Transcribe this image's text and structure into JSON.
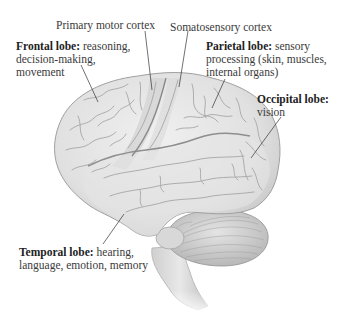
{
  "diagram": {
    "labels": [
      {
        "id": "primary-motor-cortex",
        "title": "Primary motor cortex",
        "description": ""
      },
      {
        "id": "somatosensory-cortex",
        "title": "Somatosensory cortex",
        "description": ""
      },
      {
        "id": "frontal-lobe",
        "title": "Frontal lobe:",
        "description_lines": [
          "reasoning,",
          "decision-making,",
          "movement"
        ]
      },
      {
        "id": "parietal-lobe",
        "title": "Parietal lobe:",
        "description_lines": [
          "sensory",
          "processing (skin, muscles,",
          "internal organs)"
        ]
      },
      {
        "id": "occipital-lobe",
        "title": "Occipital lobe:",
        "description_lines": [
          "vision"
        ]
      },
      {
        "id": "temporal-lobe",
        "title": "Temporal lobe:",
        "description_lines": [
          "hearing,",
          "language, emotion, memory"
        ]
      }
    ],
    "colors": {
      "brain_fill": "#e6e6e6",
      "brain_shadow": "#c4c4c4",
      "sulci": "#a9a9a9",
      "motor_strip": "#d2d2d2",
      "leader_line": "#333333",
      "text": "#333333"
    }
  }
}
